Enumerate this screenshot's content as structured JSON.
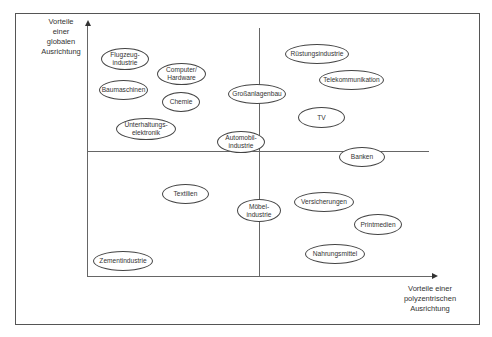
{
  "diagram": {
    "y_axis_label": "Vorteile\neiner\nglobalen\nAusrichtung",
    "x_axis_label": "Vorteile einer\npolyzentrischen\nAusrichtung",
    "industries": [
      {
        "label": "Flugzeug-\nindustrie",
        "x": 101,
        "y": 48,
        "w": 48,
        "h": 22
      },
      {
        "label": "Computer/\nHardware",
        "x": 157,
        "y": 63,
        "w": 49,
        "h": 22
      },
      {
        "label": "Baumaschinen",
        "x": 99,
        "y": 80,
        "w": 49,
        "h": 20
      },
      {
        "label": "Chemie",
        "x": 162,
        "y": 92,
        "w": 38,
        "h": 20
      },
      {
        "label": "Unterhaltungs-\nelektronik",
        "x": 116,
        "y": 118,
        "w": 60,
        "h": 22
      },
      {
        "label": "Großanlagenbau",
        "x": 228,
        "y": 84,
        "w": 58,
        "h": 20
      },
      {
        "label": "Automobil-\nindustrie",
        "x": 217,
        "y": 131,
        "w": 48,
        "h": 22
      },
      {
        "label": "Rüstungsindustrie",
        "x": 285,
        "y": 44,
        "w": 64,
        "h": 20
      },
      {
        "label": "Telekommunikation",
        "x": 319,
        "y": 70,
        "w": 65,
        "h": 20
      },
      {
        "label": "TV",
        "x": 298,
        "y": 107,
        "w": 47,
        "h": 21
      },
      {
        "label": "Banken",
        "x": 339,
        "y": 147,
        "w": 46,
        "h": 20
      },
      {
        "label": "Textilien",
        "x": 162,
        "y": 184,
        "w": 47,
        "h": 20
      },
      {
        "label": "Möbel-\nindustrie",
        "x": 237,
        "y": 199,
        "w": 44,
        "h": 23
      },
      {
        "label": "Versicherungen",
        "x": 294,
        "y": 192,
        "w": 60,
        "h": 20
      },
      {
        "label": "Printmedien",
        "x": 354,
        "y": 214,
        "w": 48,
        "h": 21
      },
      {
        "label": "Nahrungsmittel",
        "x": 305,
        "y": 244,
        "w": 60,
        "h": 20
      },
      {
        "label": "Zementindustrie",
        "x": 93,
        "y": 251,
        "w": 60,
        "h": 20
      }
    ]
  }
}
